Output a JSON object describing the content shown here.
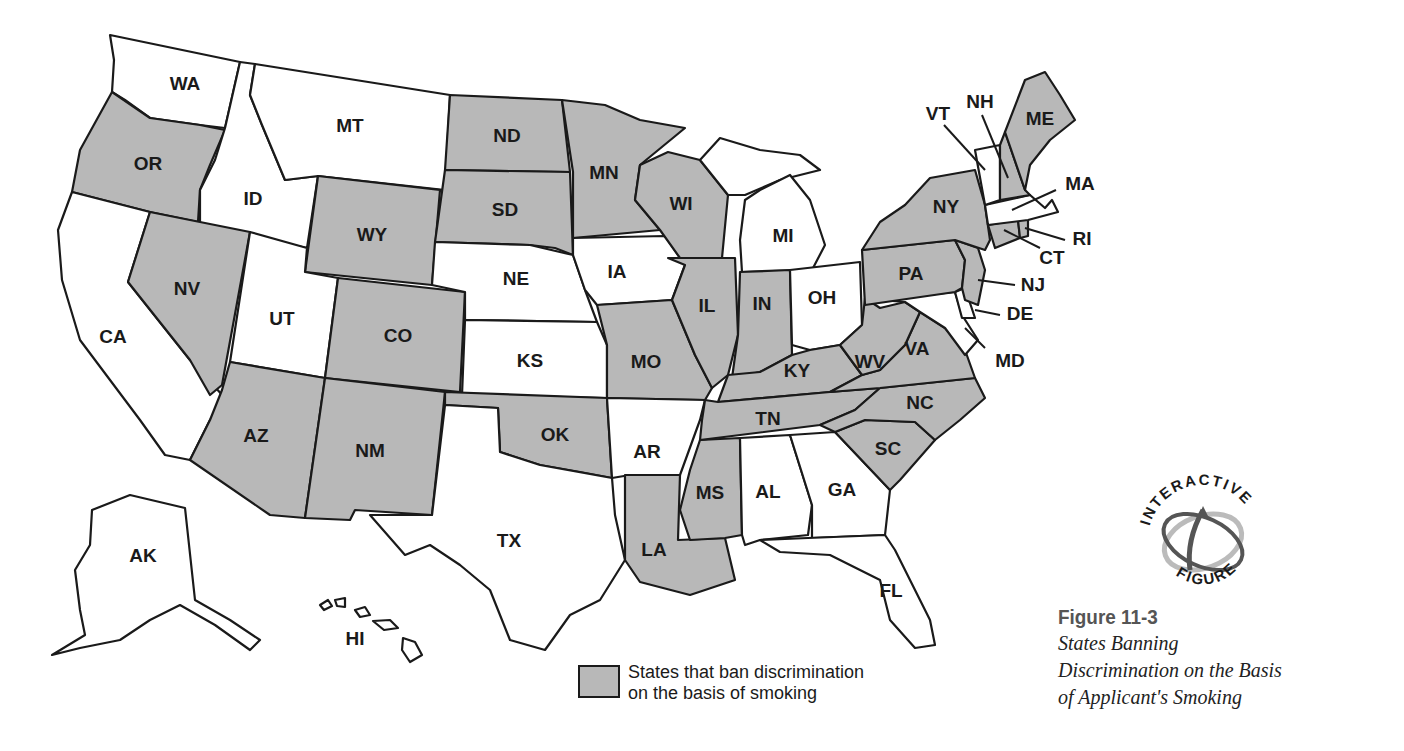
{
  "figure": {
    "number": "Figure 11-3",
    "title_lines": [
      "States Banning",
      "Discrimination on the Basis",
      "of Applicant's Smoking"
    ],
    "badge": {
      "top_text": "INTERACTIVE",
      "bottom_text": "FIGURE",
      "icon": "interactive-orbit-icon"
    }
  },
  "legend": {
    "swatch_color": "#b8b8b8",
    "lines": [
      "States that ban discrimination",
      "on the basis of smoking"
    ]
  },
  "colors": {
    "banned": "#b8b8b8",
    "not_banned": "#ffffff",
    "stroke": "#1a1a1a"
  },
  "map": {
    "states": [
      {
        "code": "WA",
        "banned": false
      },
      {
        "code": "OR",
        "banned": true
      },
      {
        "code": "CA",
        "banned": false
      },
      {
        "code": "ID",
        "banned": false
      },
      {
        "code": "NV",
        "banned": true
      },
      {
        "code": "MT",
        "banned": false
      },
      {
        "code": "WY",
        "banned": true
      },
      {
        "code": "UT",
        "banned": false
      },
      {
        "code": "AZ",
        "banned": true
      },
      {
        "code": "CO",
        "banned": true
      },
      {
        "code": "NM",
        "banned": true
      },
      {
        "code": "ND",
        "banned": true
      },
      {
        "code": "SD",
        "banned": true
      },
      {
        "code": "NE",
        "banned": false
      },
      {
        "code": "KS",
        "banned": false
      },
      {
        "code": "OK",
        "banned": true
      },
      {
        "code": "TX",
        "banned": false
      },
      {
        "code": "MN",
        "banned": true
      },
      {
        "code": "IA",
        "banned": false
      },
      {
        "code": "MO",
        "banned": true
      },
      {
        "code": "AR",
        "banned": false
      },
      {
        "code": "LA",
        "banned": true
      },
      {
        "code": "WI",
        "banned": true
      },
      {
        "code": "IL",
        "banned": true
      },
      {
        "code": "MS",
        "banned": true
      },
      {
        "code": "MI",
        "banned": false
      },
      {
        "code": "IN",
        "banned": true
      },
      {
        "code": "KY",
        "banned": true
      },
      {
        "code": "TN",
        "banned": true
      },
      {
        "code": "AL",
        "banned": false
      },
      {
        "code": "OH",
        "banned": false
      },
      {
        "code": "WV",
        "banned": true
      },
      {
        "code": "VA",
        "banned": true
      },
      {
        "code": "NC",
        "banned": true
      },
      {
        "code": "SC",
        "banned": true
      },
      {
        "code": "GA",
        "banned": false
      },
      {
        "code": "FL",
        "banned": false
      },
      {
        "code": "PA",
        "banned": true
      },
      {
        "code": "NY",
        "banned": true
      },
      {
        "code": "NJ",
        "banned": true
      },
      {
        "code": "DE",
        "banned": false
      },
      {
        "code": "MD",
        "banned": false
      },
      {
        "code": "CT",
        "banned": true
      },
      {
        "code": "RI",
        "banned": true
      },
      {
        "code": "MA",
        "banned": false
      },
      {
        "code": "VT",
        "banned": false
      },
      {
        "code": "NH",
        "banned": true
      },
      {
        "code": "ME",
        "banned": true
      },
      {
        "code": "AK",
        "banned": false
      },
      {
        "code": "HI",
        "banned": false
      }
    ]
  },
  "labels": {
    "WA": "WA",
    "OR": "OR",
    "CA": "CA",
    "ID": "ID",
    "NV": "NV",
    "MT": "MT",
    "WY": "WY",
    "UT": "UT",
    "AZ": "AZ",
    "CO": "CO",
    "NM": "NM",
    "ND": "ND",
    "SD": "SD",
    "NE": "NE",
    "KS": "KS",
    "OK": "OK",
    "TX": "TX",
    "MN": "MN",
    "IA": "IA",
    "MO": "MO",
    "AR": "AR",
    "LA": "LA",
    "WI": "WI",
    "IL": "IL",
    "MS": "MS",
    "MI": "MI",
    "IN": "IN",
    "KY": "KY",
    "TN": "TN",
    "AL": "AL",
    "OH": "OH",
    "WV": "WV",
    "VA": "VA",
    "NC": "NC",
    "SC": "SC",
    "GA": "GA",
    "FL": "FL",
    "PA": "PA",
    "NY": "NY",
    "NJ": "NJ",
    "DE": "DE",
    "MD": "MD",
    "CT": "CT",
    "RI": "RI",
    "MA": "MA",
    "VT": "VT",
    "NH": "NH",
    "ME": "ME",
    "AK": "AK",
    "HI": "HI"
  }
}
